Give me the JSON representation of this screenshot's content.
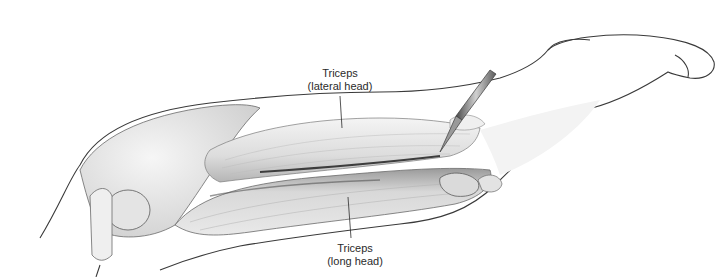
{
  "figure": {
    "labels": [
      {
        "id": "lateral",
        "line1": "Triceps",
        "line2": "(lateral head)"
      },
      {
        "id": "long",
        "line1": "Triceps",
        "line2": "(long head)"
      }
    ],
    "colors": {
      "background": "#ffffff",
      "outline": "#3a3a3a",
      "muscle_light": "#e6e6e6",
      "muscle_mid": "#c4c4c4",
      "muscle_dark": "#8a8a8a",
      "label_text": "#2b2b2b"
    }
  }
}
